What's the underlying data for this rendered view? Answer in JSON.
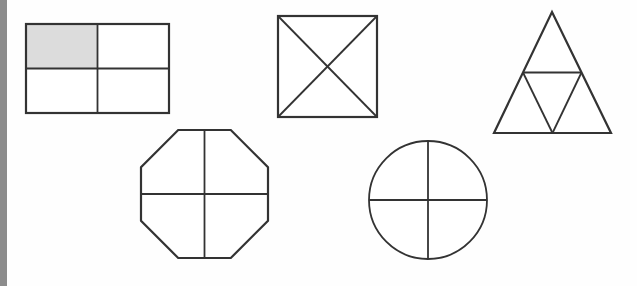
{
  "page": {
    "background_color": "#fefefe",
    "width": 637,
    "height": 286
  },
  "margin_bar": {
    "name": "left-margin-bar",
    "color": "#8c8c8c",
    "x": 0,
    "y": 0,
    "width": 7,
    "height": 286
  },
  "style": {
    "stroke_color": "#333333",
    "shaded_fill": "#dcdcdc",
    "unshaded_fill": "#ffffff",
    "outer_stroke_width": 2.2,
    "inner_stroke_width": 1.8
  },
  "figures": [
    {
      "id": "rectangle",
      "label": "Rectangle divided into fourths",
      "shape": "rectangle",
      "parts_total": 4,
      "parts_shaded": 1,
      "fraction_shaded": "1/4",
      "shaded_cells": [
        0
      ],
      "bounds": {
        "x": 26,
        "y": 24,
        "width": 143,
        "height": 89
      },
      "division_lines": [
        "vertical-midline",
        "horizontal-midline"
      ],
      "cells": [
        {
          "index": 0,
          "position": "top-left",
          "shaded": true
        },
        {
          "index": 1,
          "position": "top-right",
          "shaded": false
        },
        {
          "index": 2,
          "position": "bottom-left",
          "shaded": false
        },
        {
          "index": 3,
          "position": "bottom-right",
          "shaded": false
        }
      ]
    },
    {
      "id": "square-diagonals",
      "label": "Square divided into fourths by diagonals",
      "shape": "square",
      "parts_total": 4,
      "parts_shaded": 0,
      "fraction_shaded": "0/4",
      "bounds": {
        "x": 278,
        "y": 16,
        "width": 99,
        "height": 101
      },
      "division_lines": [
        "diagonal-tl-br",
        "diagonal-tr-bl"
      ],
      "cells": [
        {
          "index": 0,
          "position": "top-triangle",
          "shaded": false
        },
        {
          "index": 1,
          "position": "right-triangle",
          "shaded": false
        },
        {
          "index": 2,
          "position": "bottom-triangle",
          "shaded": false
        },
        {
          "index": 3,
          "position": "left-triangle",
          "shaded": false
        }
      ]
    },
    {
      "id": "triangle",
      "label": "Triangle divided into fourths by midsegments",
      "shape": "triangle",
      "parts_total": 4,
      "parts_shaded": 0,
      "fraction_shaded": "0/4",
      "apex": {
        "x": 552,
        "y": 12
      },
      "base_left": {
        "x": 494,
        "y": 133
      },
      "base_right": {
        "x": 611,
        "y": 133
      },
      "division_lines": [
        "midsegment-horizontal",
        "midsegment-left",
        "midsegment-right"
      ],
      "cells": [
        {
          "index": 0,
          "position": "top-triangle",
          "shaded": false
        },
        {
          "index": 1,
          "position": "bottom-left-triangle",
          "shaded": false
        },
        {
          "index": 2,
          "position": "center-inverted-triangle",
          "shaded": false
        },
        {
          "index": 3,
          "position": "bottom-right-triangle",
          "shaded": false
        }
      ]
    },
    {
      "id": "octagon",
      "label": "Octagon divided into fourths",
      "shape": "octagon",
      "parts_total": 4,
      "parts_shaded": 0,
      "fraction_shaded": "0/4",
      "bounds": {
        "x": 141,
        "y": 130,
        "width": 127,
        "height": 128
      },
      "division_lines": [
        "vertical-midline",
        "horizontal-midline"
      ],
      "cells": [
        {
          "index": 0,
          "position": "top-left",
          "shaded": false
        },
        {
          "index": 1,
          "position": "top-right",
          "shaded": false
        },
        {
          "index": 2,
          "position": "bottom-left",
          "shaded": false
        },
        {
          "index": 3,
          "position": "bottom-right",
          "shaded": false
        }
      ]
    },
    {
      "id": "circle",
      "label": "Circle divided into fourths",
      "shape": "circle",
      "parts_total": 4,
      "parts_shaded": 0,
      "fraction_shaded": "0/4",
      "center": {
        "x": 428,
        "y": 200
      },
      "radius": 59,
      "division_lines": [
        "vertical-diameter",
        "horizontal-diameter"
      ],
      "cells": [
        {
          "index": 0,
          "position": "top-left-quadrant",
          "shaded": false
        },
        {
          "index": 1,
          "position": "top-right-quadrant",
          "shaded": false
        },
        {
          "index": 2,
          "position": "bottom-left-quadrant",
          "shaded": false
        },
        {
          "index": 3,
          "position": "bottom-right-quadrant",
          "shaded": false
        }
      ]
    }
  ]
}
